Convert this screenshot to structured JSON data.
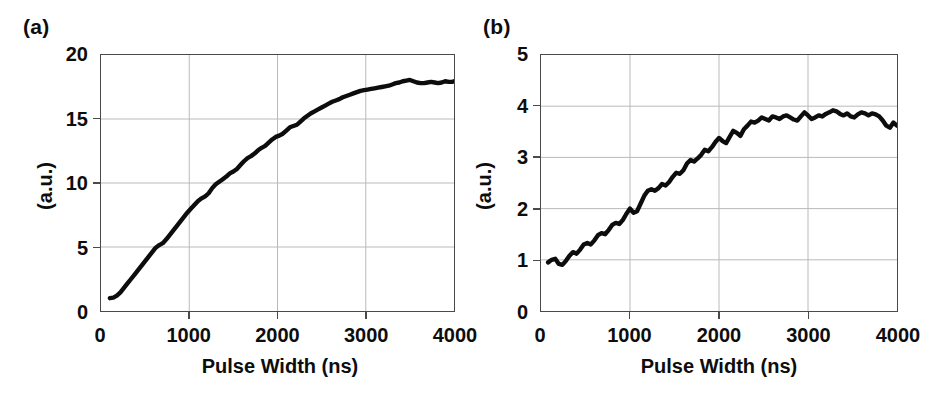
{
  "figure": {
    "background": "#ffffff",
    "line_color": "#0d0d0d",
    "axis_color": "#4a4a4a",
    "grid_color": "#b9b9b9"
  },
  "panels": [
    {
      "label": "(a)",
      "xlabel": "Pulse Width (ns)",
      "ylabel": "(a.u.)",
      "yticks": [
        "0",
        "5",
        "10",
        "15",
        "20"
      ],
      "xticks": [
        "0",
        "1000",
        "2000",
        "3000",
        "4000"
      ]
    },
    {
      "label": "(b)",
      "xlabel": "Pulse Width (ns)",
      "ylabel": "(a.u.)",
      "yticks": [
        "0",
        "1",
        "2",
        "3",
        "4",
        "5"
      ],
      "xticks": [
        "0",
        "1000",
        "2000",
        "3000",
        "4000"
      ]
    }
  ],
  "chart_data": [
    {
      "type": "line",
      "title": "(a)",
      "xlabel": "Pulse Width (ns)",
      "ylabel": "(a.u.)",
      "xlim": [
        0,
        4000
      ],
      "ylim": [
        0,
        20
      ],
      "xticks": [
        0,
        1000,
        2000,
        3000,
        4000
      ],
      "yticks": [
        0,
        5,
        10,
        15,
        20
      ],
      "grid": true,
      "legend": "none",
      "series": [
        {
          "name": "signal-a",
          "x": [
            100,
            140,
            180,
            220,
            260,
            300,
            340,
            380,
            420,
            460,
            500,
            540,
            580,
            620,
            660,
            700,
            740,
            780,
            820,
            860,
            900,
            940,
            980,
            1020,
            1060,
            1100,
            1140,
            1180,
            1220,
            1260,
            1300,
            1340,
            1380,
            1420,
            1460,
            1500,
            1540,
            1580,
            1620,
            1660,
            1700,
            1740,
            1780,
            1820,
            1860,
            1900,
            1940,
            1980,
            2020,
            2060,
            2100,
            2140,
            2180,
            2220,
            2260,
            2300,
            2340,
            2380,
            2420,
            2460,
            2500,
            2540,
            2580,
            2620,
            2660,
            2700,
            2740,
            2780,
            2820,
            2860,
            2900,
            2940,
            2980,
            3020,
            3060,
            3100,
            3140,
            3180,
            3220,
            3260,
            3300,
            3340,
            3380,
            3420,
            3460,
            3500,
            3540,
            3580,
            3620,
            3660,
            3700,
            3740,
            3780,
            3820,
            3860,
            3900,
            3940,
            3980,
            4000
          ],
          "y": [
            1.0,
            1.05,
            1.2,
            1.45,
            1.8,
            2.15,
            2.5,
            2.85,
            3.2,
            3.55,
            3.9,
            4.25,
            4.6,
            4.95,
            5.15,
            5.3,
            5.6,
            5.95,
            6.3,
            6.65,
            7.0,
            7.35,
            7.7,
            8.0,
            8.3,
            8.6,
            8.8,
            8.95,
            9.2,
            9.6,
            9.9,
            10.1,
            10.3,
            10.5,
            10.75,
            10.9,
            11.1,
            11.4,
            11.7,
            11.95,
            12.1,
            12.3,
            12.55,
            12.75,
            12.9,
            13.15,
            13.4,
            13.6,
            13.7,
            13.85,
            14.1,
            14.35,
            14.45,
            14.55,
            14.8,
            15.05,
            15.25,
            15.45,
            15.6,
            15.75,
            15.9,
            16.05,
            16.2,
            16.35,
            16.45,
            16.55,
            16.7,
            16.8,
            16.9,
            17.0,
            17.1,
            17.2,
            17.25,
            17.3,
            17.35,
            17.4,
            17.45,
            17.5,
            17.55,
            17.6,
            17.7,
            17.8,
            17.85,
            17.95,
            18.0,
            18.05,
            17.95,
            17.85,
            17.8,
            17.8,
            17.85,
            17.9,
            17.85,
            17.8,
            17.85,
            17.95,
            17.9,
            17.9,
            17.95
          ]
        }
      ]
    },
    {
      "type": "line",
      "title": "(b)",
      "xlabel": "Pulse Width (ns)",
      "ylabel": "(a.u.)",
      "xlim": [
        0,
        4000
      ],
      "ylim": [
        0,
        5
      ],
      "xticks": [
        0,
        1000,
        2000,
        3000,
        4000
      ],
      "yticks": [
        0,
        1,
        2,
        3,
        4,
        5
      ],
      "grid": true,
      "legend": "none",
      "series": [
        {
          "name": "signal-b",
          "x": [
            80,
            120,
            160,
            200,
            240,
            280,
            320,
            360,
            400,
            440,
            480,
            520,
            560,
            600,
            640,
            680,
            720,
            760,
            800,
            840,
            880,
            920,
            960,
            1000,
            1040,
            1080,
            1120,
            1160,
            1200,
            1240,
            1280,
            1320,
            1360,
            1400,
            1440,
            1480,
            1520,
            1560,
            1600,
            1640,
            1680,
            1720,
            1760,
            1800,
            1840,
            1880,
            1920,
            1960,
            2000,
            2040,
            2080,
            2120,
            2160,
            2200,
            2240,
            2280,
            2320,
            2360,
            2400,
            2440,
            2480,
            2520,
            2560,
            2600,
            2640,
            2680,
            2720,
            2760,
            2800,
            2840,
            2880,
            2920,
            2960,
            3000,
            3040,
            3080,
            3120,
            3160,
            3200,
            3240,
            3280,
            3320,
            3360,
            3400,
            3440,
            3480,
            3520,
            3560,
            3600,
            3640,
            3680,
            3720,
            3760,
            3800,
            3840,
            3880,
            3920,
            3960,
            4000
          ],
          "y": [
            0.95,
            1.0,
            1.02,
            0.92,
            0.9,
            0.98,
            1.08,
            1.15,
            1.12,
            1.2,
            1.3,
            1.33,
            1.3,
            1.38,
            1.48,
            1.52,
            1.5,
            1.58,
            1.68,
            1.72,
            1.7,
            1.78,
            1.9,
            2.0,
            1.92,
            1.95,
            2.1,
            2.25,
            2.35,
            2.38,
            2.35,
            2.4,
            2.48,
            2.45,
            2.52,
            2.62,
            2.7,
            2.68,
            2.75,
            2.88,
            2.95,
            2.92,
            2.98,
            3.05,
            3.15,
            3.12,
            3.2,
            3.3,
            3.38,
            3.32,
            3.28,
            3.4,
            3.52,
            3.48,
            3.42,
            3.55,
            3.62,
            3.7,
            3.68,
            3.72,
            3.78,
            3.75,
            3.72,
            3.8,
            3.78,
            3.75,
            3.8,
            3.82,
            3.78,
            3.74,
            3.72,
            3.8,
            3.88,
            3.82,
            3.75,
            3.78,
            3.82,
            3.8,
            3.85,
            3.88,
            3.92,
            3.9,
            3.85,
            3.82,
            3.86,
            3.8,
            3.78,
            3.84,
            3.88,
            3.86,
            3.82,
            3.86,
            3.84,
            3.8,
            3.72,
            3.62,
            3.58,
            3.68,
            3.62
          ]
        }
      ]
    }
  ]
}
